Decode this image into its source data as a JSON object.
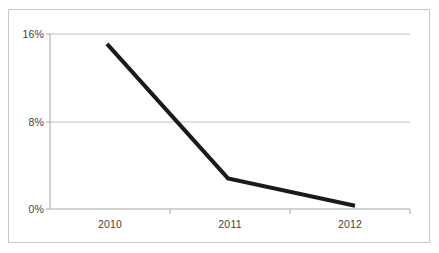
{
  "chart_data": {
    "type": "line",
    "title": "",
    "subtitle": "",
    "xlabel": "",
    "ylabel": "",
    "categories": [
      "2010",
      "2011",
      "2012"
    ],
    "x_tick_labels": [
      "2010",
      "2011",
      "2012"
    ],
    "y_tick_labels": [
      "0%",
      "8%",
      "16%"
    ],
    "ylim": [
      0,
      16
    ],
    "y_ticks": [
      0,
      8,
      16
    ],
    "grid": "horizontal",
    "legend": "none",
    "series": [
      {
        "name": "series-1",
        "color": "#1a1a1a",
        "line_width": 4,
        "markers": "none",
        "values": [
          15.1,
          2.8,
          0.3
        ]
      }
    ],
    "annotations": [],
    "colors": {
      "line": "#1a1a1a",
      "gridline": "#bfbfbf",
      "axis": "#a6a6a6",
      "frame_border": "#c9c9c9",
      "tick_text": "#3f3f3f",
      "plot_background": "#ffffff"
    }
  },
  "axis": {
    "y_ticks": [
      {
        "label": "16%",
        "value": 16
      },
      {
        "label": "8%",
        "value": 8
      },
      {
        "label": "0%",
        "value": 0
      }
    ],
    "x_ticks": [
      {
        "label": "2010"
      },
      {
        "label": "2011"
      },
      {
        "label": "2012"
      }
    ]
  }
}
